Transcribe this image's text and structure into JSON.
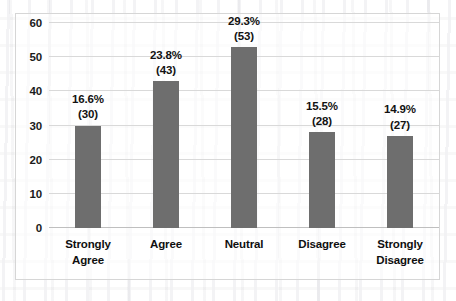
{
  "chart_data": {
    "type": "bar",
    "title": "",
    "xlabel": "",
    "ylabel": "",
    "ylim": [
      0,
      60
    ],
    "ytick_step": 10,
    "yticks": [
      "0",
      "10",
      "20",
      "30",
      "40",
      "50",
      "60"
    ],
    "grid": true,
    "legend": "none",
    "bar_color": "#6e6e6e",
    "gridline_color": "#d9d9d9",
    "border_color": "#d6d6d6",
    "categories": [
      "Strongly Agree",
      "Agree",
      "Neutral",
      "Disagree",
      "Strongly Disagree"
    ],
    "category_lines": [
      [
        "Strongly",
        "Agree"
      ],
      [
        "Agree"
      ],
      [
        "Neutral"
      ],
      [
        "Disagree"
      ],
      [
        "Strongly",
        "Disagree"
      ]
    ],
    "values": [
      30,
      43,
      53,
      28,
      27
    ],
    "percent_labels": [
      "16.6%",
      "23.8%",
      "29.3%",
      "15.5%",
      "14.9%"
    ],
    "count_labels": [
      "(30)",
      "(43)",
      "(53)",
      "(28)",
      "(27)"
    ],
    "percents": [
      16.6,
      23.8,
      29.3,
      15.5,
      14.9
    ],
    "total": 181
  }
}
